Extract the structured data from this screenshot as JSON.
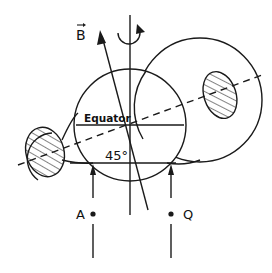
{
  "diagram": {
    "labels": {
      "field_vector": "B",
      "equator": "Equator",
      "angle": "45°",
      "point_a": "A",
      "point_q": "Q"
    },
    "colors": {
      "line": "#1a1a1a",
      "background": "#ffffff"
    },
    "elements": {
      "earth_circle": {
        "cx": 130,
        "cy": 125,
        "r": 56
      },
      "orbit_circle_right": {
        "cx": 200,
        "cy": 100,
        "r": 62
      },
      "hatched_region_left": {
        "cx": 45,
        "cy": 152,
        "rx": 19,
        "ry": 25
      },
      "hatched_region_right": {
        "cx": 220,
        "cy": 95,
        "rx": 16,
        "ry": 24
      },
      "rotation_axis": {
        "x": 130,
        "y1": 15,
        "y2": 215
      },
      "magnetic_axis_dashed": {
        "x1": 18,
        "y1": 165,
        "x2": 262,
        "y2": 75
      }
    }
  }
}
